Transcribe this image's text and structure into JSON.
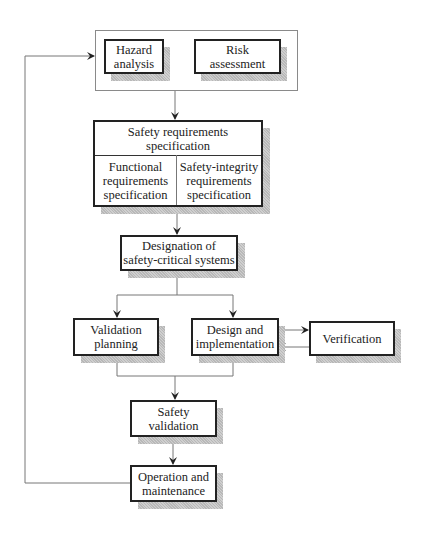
{
  "diagram": {
    "nodes": {
      "hazard": {
        "line1": "Hazard",
        "line2": "analysis"
      },
      "risk": {
        "line1": "Risk",
        "line2": "assessment"
      },
      "safety_req": {
        "line1": "Safety requirements",
        "line2": "specification"
      },
      "functional": {
        "line1": "Functional",
        "line2": "requirements",
        "line3": "specification"
      },
      "integrity": {
        "line1": "Safety-integrity",
        "line2": "requirements",
        "line3": "specification"
      },
      "designation": {
        "line1": "Designation of",
        "line2": "safety-critical systems"
      },
      "validation_planning": {
        "line1": "Validation",
        "line2": "planning"
      },
      "design": {
        "line1": "Design and",
        "line2": "implementation"
      },
      "verification": {
        "line1": "Verification"
      },
      "safety_validation": {
        "line1": "Safety",
        "line2": "validation"
      },
      "operation": {
        "line1": "Operation and",
        "line2": "maintenance"
      }
    },
    "edges": [
      "hazard+risk -> safety_req",
      "safety_req -> designation",
      "designation -> validation_planning",
      "designation -> design",
      "design -> verification",
      "verification -> design",
      "validation_planning + design -> safety_validation",
      "safety_validation -> operation",
      "operation -> hazard (feedback)"
    ]
  }
}
